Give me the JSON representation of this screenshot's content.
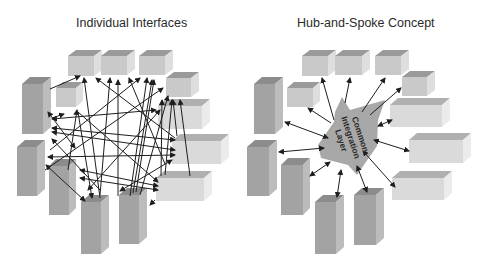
{
  "left_panel": {
    "title": "Individual Interfaces"
  },
  "right_panel": {
    "title": "Hub-and-Spoke Concept",
    "hub_label_lines": [
      "Common",
      "Integration",
      "Layer"
    ]
  },
  "colors": {
    "tall_front": "#a3a3a3",
    "tall_side": "#bcbcbc",
    "tall_top": "#8c8c8c",
    "box_front": "#c9c9c9",
    "box_side": "#dedede",
    "box_top": "#9a9a9a",
    "light_front": "#dadada",
    "light_side": "#ebebeb",
    "light_top": "#b0b0b0",
    "hub": "#a8a8a8",
    "arrow": "#1e1e1e"
  }
}
